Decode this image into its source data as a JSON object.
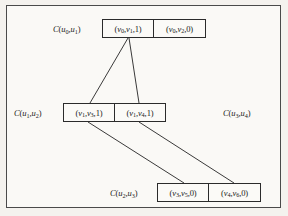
{
  "figure": {
    "kind": "adjacency-multilist-diagram",
    "background_color": "#faf9f6",
    "border_color": "#4a4a4a",
    "box_border_color": "#2b2b2b",
    "edge_color": "#3a3a3a"
  },
  "labels": {
    "c01": "C(u0,u1)",
    "c12": "C(u1,u2)",
    "c34": "C(u3,u4)",
    "c23": "C(u2,u3)"
  },
  "rows": [
    {
      "id": "row-top",
      "label_ref": "c01",
      "cells": [
        {
          "text": "(v0,v1,1)",
          "mark": "1"
        },
        {
          "text": "(v0,v2,0)",
          "mark": "0"
        }
      ]
    },
    {
      "id": "row-mid",
      "label_ref": "c12",
      "cells": [
        {
          "text": "(v1,v3,1)",
          "mark": "1"
        },
        {
          "text": "(v1,v4,1)",
          "mark": "1"
        }
      ]
    },
    {
      "id": "row-bot",
      "label_ref": "c23",
      "cells": [
        {
          "text": "(v3,v5,0)",
          "mark": "0"
        },
        {
          "text": "(v4,v6,0)",
          "mark": "0"
        }
      ]
    }
  ],
  "edges": [
    {
      "from": "row-top-cell-1",
      "to": "row-mid-cell-1",
      "x1": 128,
      "y1": 38,
      "x2": 90,
      "y2": 103
    },
    {
      "from": "row-top-cell-1",
      "to": "row-mid-cell-2",
      "x1": 129,
      "y1": 38,
      "x2": 139,
      "y2": 103
    },
    {
      "from": "row-mid-cell-1",
      "to": "row-bot-cell-1",
      "x1": 88,
      "y1": 122,
      "x2": 184,
      "y2": 183
    },
    {
      "from": "row-mid-cell-2",
      "to": "row-bot-cell-2",
      "x1": 139,
      "y1": 122,
      "x2": 234,
      "y2": 183
    }
  ]
}
